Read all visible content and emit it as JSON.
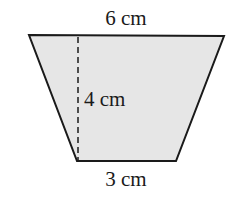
{
  "figure": {
    "shape": "trapezoid",
    "fill_color": "#e6e6e6",
    "stroke_color": "#1a1a1a",
    "vertices": {
      "top_left": [
        29,
        35
      ],
      "top_right": [
        224,
        36
      ],
      "bottom_right": [
        176,
        161
      ],
      "bottom_left": [
        77,
        161
      ]
    },
    "height_line": {
      "x": 78,
      "y1": 36,
      "y2": 160,
      "style": "dashed"
    },
    "labels": {
      "top": "6 cm",
      "height": "4 cm",
      "bottom": "3 cm"
    }
  }
}
